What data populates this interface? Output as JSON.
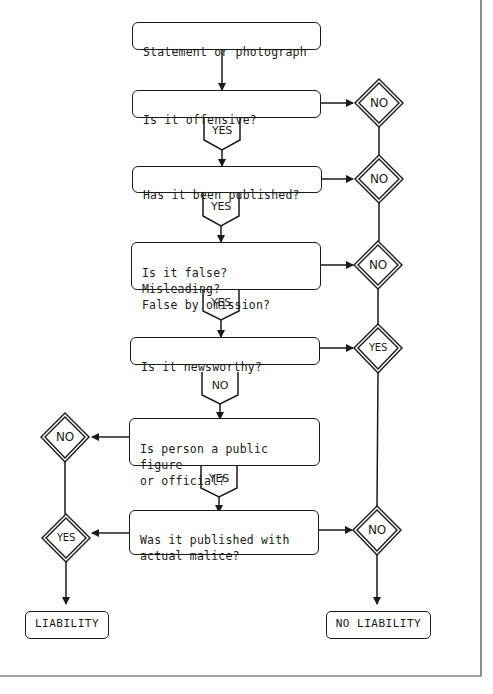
{
  "diagram": {
    "type": "flowchart",
    "start": {
      "label": "Statement or photograph"
    },
    "questions": [
      {
        "id": "q1",
        "label": "Is it offensive?",
        "down_tag": "YES",
        "side_result": "NO",
        "side": "right"
      },
      {
        "id": "q2",
        "label": "Has it been published?",
        "down_tag": "YES",
        "side_result": "NO",
        "side": "right"
      },
      {
        "id": "q3",
        "label": "Is it false?  Misleading?\nFalse by omission?",
        "down_tag": "YES",
        "side_result": "NO",
        "side": "right"
      },
      {
        "id": "q4",
        "label": "Is it newsworthy?",
        "down_tag": "NO",
        "side_result": "YES",
        "side": "right"
      },
      {
        "id": "q5",
        "label": "Is person a public figure\nor official?",
        "down_tag": "YES",
        "side_result": "NO",
        "side": "left"
      },
      {
        "id": "q6",
        "label": "Was it published with\nactual malice?",
        "side_results": {
          "left": "YES",
          "right": "NO"
        }
      }
    ],
    "outcomes": {
      "left": "LIABILITY",
      "right": "NO LIABILITY"
    }
  }
}
